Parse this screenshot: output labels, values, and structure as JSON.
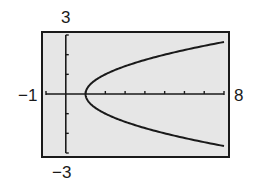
{
  "chart_data": {
    "type": "line",
    "title": "",
    "xlabel": "",
    "ylabel": "",
    "xlim": [
      -1,
      8
    ],
    "ylim": [
      -3,
      3
    ],
    "grid": false,
    "legend": null,
    "window_labels": {
      "xmin": "−1",
      "xmax": "8",
      "ymin": "−3",
      "ymax": "3"
    },
    "x_ticks": [
      1,
      2,
      3,
      4,
      5,
      6,
      7
    ],
    "y_ticks": [
      -2,
      -1,
      1,
      2
    ],
    "series": [
      {
        "name": "upper branch",
        "description": "y = sqrt(x - 1)",
        "x": [
          1,
          1.25,
          1.5,
          2,
          3,
          4,
          5,
          6,
          7,
          8
        ],
        "values": [
          0,
          0.5,
          0.71,
          1.0,
          1.41,
          1.73,
          2.0,
          2.24,
          2.45,
          2.65
        ]
      },
      {
        "name": "lower branch",
        "description": "y = -sqrt(x - 1)",
        "x": [
          1,
          1.25,
          1.5,
          2,
          3,
          4,
          5,
          6,
          7,
          8
        ],
        "values": [
          0,
          -0.5,
          -0.71,
          -1.0,
          -1.41,
          -1.73,
          -2.0,
          -2.24,
          -2.45,
          -2.65
        ]
      }
    ],
    "colors": {
      "background": "#e6e6e6",
      "frame": "#1a1a1a",
      "curve": "#1a1a1a"
    }
  }
}
